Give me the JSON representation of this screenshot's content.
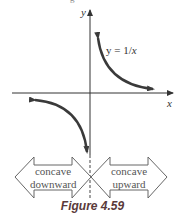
{
  "figure": {
    "caption": "Figure 4.59",
    "top_fragment": "g",
    "axes": {
      "x_label": "x",
      "y_label": "y"
    },
    "curve_label": {
      "prefix": "y = 1/",
      "var": "x"
    },
    "regions": [
      {
        "line1": "concave",
        "line2": "downward"
      },
      {
        "line1": "concave",
        "line2": "upward"
      }
    ],
    "colors": {
      "curve": "#3a3a3a",
      "axis": "#333333",
      "arrow_outline": "#666666"
    }
  }
}
